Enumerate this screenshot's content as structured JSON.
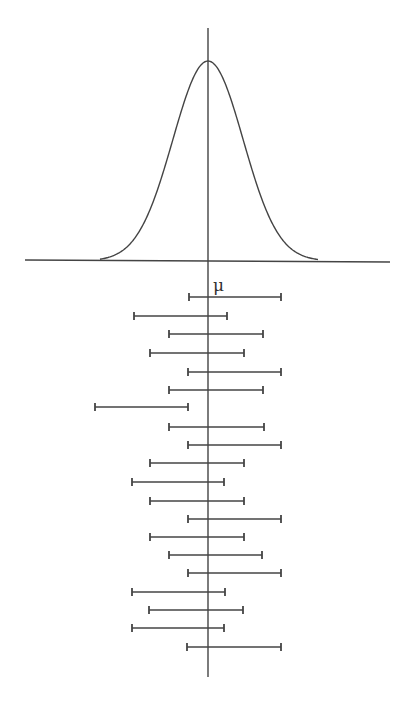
{
  "diagram": {
    "mean_label": "μ",
    "colors": {
      "stroke": "#444444",
      "background": "#ffffff"
    },
    "axis": {
      "mean_x": 208,
      "vertical_top": 28,
      "vertical_bottom": 677,
      "baseline_y": 261,
      "baseline_x1": 25,
      "baseline_x2": 390
    },
    "curve": {
      "type": "normal",
      "peak_y": 61,
      "left_foot_x": 100,
      "right_foot_x": 318
    },
    "intervals": [
      {
        "y": 297,
        "lo": 189,
        "hi": 281
      },
      {
        "y": 316,
        "lo": 134,
        "hi": 227
      },
      {
        "y": 334,
        "lo": 169,
        "hi": 263
      },
      {
        "y": 353,
        "lo": 150,
        "hi": 244
      },
      {
        "y": 372,
        "lo": 188,
        "hi": 281
      },
      {
        "y": 390,
        "lo": 169,
        "hi": 263
      },
      {
        "y": 407,
        "lo": 95,
        "hi": 188
      },
      {
        "y": 427,
        "lo": 169,
        "hi": 264
      },
      {
        "y": 445,
        "lo": 188,
        "hi": 281
      },
      {
        "y": 463,
        "lo": 150,
        "hi": 244
      },
      {
        "y": 482,
        "lo": 132,
        "hi": 224
      },
      {
        "y": 501,
        "lo": 150,
        "hi": 244
      },
      {
        "y": 519,
        "lo": 188,
        "hi": 281
      },
      {
        "y": 537,
        "lo": 150,
        "hi": 244
      },
      {
        "y": 555,
        "lo": 169,
        "hi": 262
      },
      {
        "y": 573,
        "lo": 188,
        "hi": 281
      },
      {
        "y": 592,
        "lo": 132,
        "hi": 225
      },
      {
        "y": 610,
        "lo": 149,
        "hi": 243
      },
      {
        "y": 628,
        "lo": 132,
        "hi": 224
      },
      {
        "y": 647,
        "lo": 187,
        "hi": 281
      }
    ]
  }
}
